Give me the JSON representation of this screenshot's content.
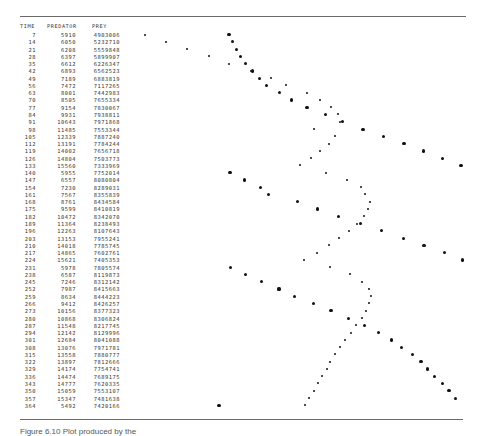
{
  "table": {
    "headers": {
      "time": "TIME",
      "predator": "PREDATOR",
      "prey": "PREY"
    },
    "rows": [
      [
        "7",
        "5910",
        "4903006"
      ],
      [
        "14",
        "6050",
        "5232710"
      ],
      [
        "21",
        "6208",
        "5559848"
      ],
      [
        "28",
        "6397",
        "5899907"
      ],
      [
        "35",
        "6612",
        "6226347"
      ],
      [
        "42",
        "6893",
        "6562523"
      ],
      [
        "49",
        "7189",
        "6883819"
      ],
      [
        "56",
        "7472",
        "7117265"
      ],
      [
        "63",
        "8001",
        "7442983"
      ],
      [
        "70",
        "8505",
        "7655334"
      ],
      [
        "77",
        "9154",
        "7830067"
      ],
      [
        "84",
        "9931",
        "7938811"
      ],
      [
        "91",
        "10643",
        "7971868"
      ],
      [
        "98",
        "11485",
        "7553344"
      ],
      [
        "105",
        "12339",
        "7887240"
      ],
      [
        "112",
        "13191",
        "7784244"
      ],
      [
        "119",
        "14002",
        "7656718"
      ],
      [
        "126",
        "14804",
        "7503773"
      ],
      [
        "133",
        "15560",
        "7333969"
      ],
      [
        "140",
        "5955",
        "7752014"
      ],
      [
        "147",
        "6557",
        "8080804"
      ],
      [
        "154",
        "7230",
        "8289031"
      ],
      [
        "161",
        "7567",
        "8355839"
      ],
      [
        "168",
        "8761",
        "8434584"
      ],
      [
        "175",
        "9599",
        "8410819"
      ],
      [
        "182",
        "10472",
        "8342070"
      ],
      [
        "189",
        "11364",
        "8238493"
      ],
      [
        "196",
        "12263",
        "8107643"
      ],
      [
        "203",
        "13153",
        "7955241"
      ],
      [
        "210",
        "14018",
        "7785745"
      ],
      [
        "217",
        "14865",
        "7602761"
      ],
      [
        "224",
        "15621",
        "7405353"
      ],
      [
        "231",
        "5978",
        "7805574"
      ],
      [
        "238",
        "6587",
        "8119873"
      ],
      [
        "245",
        "7246",
        "8312142"
      ],
      [
        "252",
        "7987",
        "8415663"
      ],
      [
        "259",
        "8634",
        "8444223"
      ],
      [
        "266",
        "9412",
        "8426257"
      ],
      [
        "273",
        "10156",
        "8377323"
      ],
      [
        "280",
        "10868",
        "8306824"
      ],
      [
        "287",
        "11548",
        "8217745"
      ],
      [
        "294",
        "12142",
        "8129996"
      ],
      [
        "301",
        "12684",
        "8041088"
      ],
      [
        "308",
        "13076",
        "7971781"
      ],
      [
        "315",
        "13558",
        "7880777"
      ],
      [
        "322",
        "13897",
        "7812666"
      ],
      [
        "329",
        "14174",
        "7754741"
      ],
      [
        "336",
        "14474",
        "7689175"
      ],
      [
        "343",
        "14777",
        "7620335"
      ],
      [
        "350",
        "15059",
        "7553107"
      ],
      [
        "357",
        "15347",
        "7481638"
      ],
      [
        "364",
        "5492",
        "7420166"
      ]
    ]
  },
  "chart_data": {
    "type": "scatter",
    "title": "",
    "xlabel": "",
    "ylabel": "",
    "orientation": "rows are time steps (vertical), values plotted horizontally per row",
    "series": [
      {
        "name": "PREDATOR",
        "marker": "large dot",
        "source_column": 1
      },
      {
        "name": "PREY",
        "marker": "small dot",
        "source_column": 2
      }
    ],
    "x_time": [
      7,
      14,
      21,
      28,
      35,
      42,
      49,
      56,
      63,
      70,
      77,
      84,
      91,
      98,
      105,
      112,
      119,
      126,
      133,
      140,
      147,
      154,
      161,
      168,
      175,
      182,
      189,
      196,
      203,
      210,
      217,
      224,
      231,
      238,
      245,
      252,
      259,
      266,
      273,
      280,
      287,
      294,
      301,
      308,
      315,
      322,
      329,
      336,
      343,
      350,
      357,
      364
    ],
    "predator": [
      5910,
      6050,
      6208,
      6397,
      6612,
      6893,
      7189,
      7472,
      8001,
      8505,
      9154,
      9931,
      10643,
      11485,
      12339,
      13191,
      14002,
      14804,
      15560,
      5955,
      6557,
      7230,
      7567,
      8761,
      9599,
      10472,
      11364,
      12263,
      13153,
      14018,
      14865,
      15621,
      5978,
      6587,
      7246,
      7987,
      8634,
      9412,
      10156,
      10868,
      11548,
      12142,
      12684,
      13076,
      13558,
      13897,
      14174,
      14474,
      14777,
      15059,
      15347,
      5492
    ],
    "prey": [
      4903006,
      5232710,
      5559848,
      5899907,
      6226347,
      6562523,
      6883819,
      7117265,
      7442983,
      7655334,
      7830067,
      7938811,
      7971868,
      7553344,
      7887240,
      7784244,
      7656718,
      7503773,
      7333969,
      7752014,
      8080804,
      8289031,
      8355839,
      8434584,
      8410819,
      8342070,
      8238493,
      8107643,
      7955241,
      7785745,
      7602761,
      7405353,
      7805574,
      8119873,
      8312142,
      8415663,
      8444223,
      8426257,
      8377323,
      8306824,
      8217745,
      8129996,
      8041088,
      7971781,
      7880777,
      7812666,
      7754741,
      7689175,
      7620335,
      7553107,
      7481638,
      7420166
    ],
    "grid": false,
    "legend": "none"
  },
  "caption": "Figure 6.10 Plot produced by the"
}
